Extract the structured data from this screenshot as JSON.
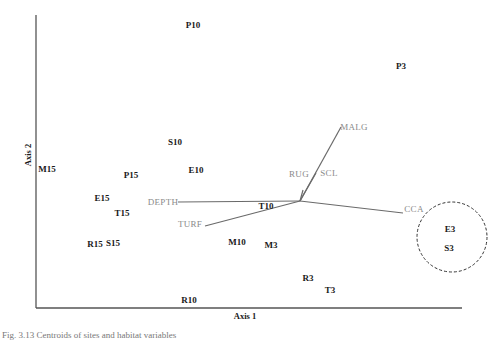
{
  "chart_data": {
    "type": "scatter",
    "title": "",
    "xlabel": "Axis 1",
    "ylabel": "Axis 2",
    "grid": false,
    "legend": null,
    "points": [
      {
        "label": "P10",
        "x": 193,
        "y": 25
      },
      {
        "label": "P3",
        "x": 401,
        "y": 66
      },
      {
        "label": "S10",
        "x": 175,
        "y": 142
      },
      {
        "label": "M15",
        "x": 47,
        "y": 169
      },
      {
        "label": "P15",
        "x": 131,
        "y": 175
      },
      {
        "label": "E10",
        "x": 196,
        "y": 170
      },
      {
        "label": "E15",
        "x": 102,
        "y": 198
      },
      {
        "label": "T15",
        "x": 122,
        "y": 213
      },
      {
        "label": "T10",
        "x": 266,
        "y": 206
      },
      {
        "label": "R15",
        "x": 95,
        "y": 244
      },
      {
        "label": "S15",
        "x": 113,
        "y": 243
      },
      {
        "label": "M10",
        "x": 237,
        "y": 242
      },
      {
        "label": "M3",
        "x": 271,
        "y": 245
      },
      {
        "label": "E3",
        "x": 450,
        "y": 229
      },
      {
        "label": "S3",
        "x": 449,
        "y": 248
      },
      {
        "label": "R3",
        "x": 308,
        "y": 278
      },
      {
        "label": "T3",
        "x": 330,
        "y": 290
      },
      {
        "label": "R10",
        "x": 189,
        "y": 300
      }
    ],
    "vectors": {
      "origin": {
        "x": 300,
        "y": 201
      },
      "items": [
        {
          "label": "MALG",
          "tip_x": 341,
          "tip_y": 127,
          "label_x": 354,
          "label_y": 127
        },
        {
          "label": "SCL",
          "tip_x": 316,
          "tip_y": 173,
          "label_x": 329,
          "label_y": 173
        },
        {
          "label": "RUG",
          "tip_x": 303,
          "tip_y": 190,
          "label_x": 299,
          "label_y": 174
        },
        {
          "label": "DEPTH",
          "tip_x": 178,
          "tip_y": 202,
          "label_x": 163,
          "label_y": 202
        },
        {
          "label": "TURF",
          "tip_x": 205,
          "tip_y": 226,
          "label_x": 190,
          "label_y": 224
        },
        {
          "label": "CCA",
          "tip_x": 403,
          "tip_y": 213,
          "label_x": 414,
          "label_y": 209
        }
      ]
    },
    "annotations": [
      {
        "type": "dashed-circle",
        "cx": 452,
        "cy": 237,
        "r": 35,
        "encloses": [
          "E3",
          "S3"
        ]
      }
    ]
  },
  "caption": "Fig. 3.13  Centroids of sites and habitat variables"
}
